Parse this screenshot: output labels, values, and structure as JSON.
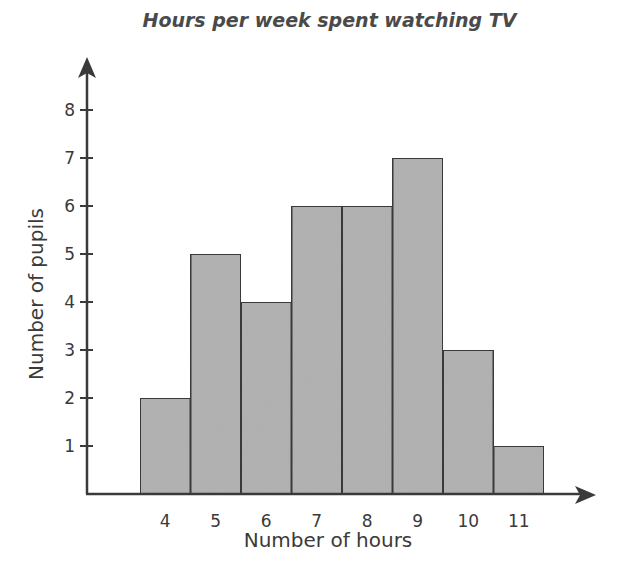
{
  "chart_data": {
    "type": "bar",
    "title": "Hours per week spent watching TV",
    "xlabel": "Number of hours",
    "ylabel": "Number of pupils",
    "categories": [
      "4",
      "5",
      "6",
      "7",
      "8",
      "9",
      "10",
      "11"
    ],
    "values": [
      2,
      5,
      4,
      6,
      6,
      7,
      3,
      1
    ],
    "y_ticks": [
      "1",
      "2",
      "3",
      "4",
      "5",
      "6",
      "7",
      "8"
    ],
    "ylim": [
      0,
      8
    ],
    "grid": false,
    "legend": null,
    "bar_color": "#b3b3b3",
    "bar_edge_color": "#3a3a3a"
  }
}
